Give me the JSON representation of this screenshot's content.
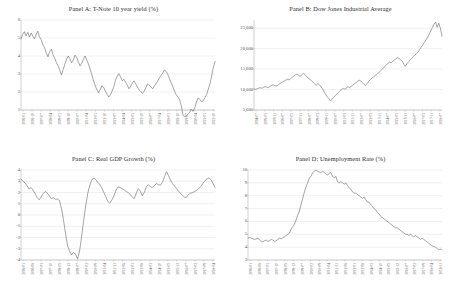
{
  "figure": {
    "background": "#ffffff",
    "line_color": "#5a5a5a",
    "grid_color": "#d9d9d9",
    "axis_color": "#9a9a9a",
    "panel_count": 4
  },
  "panels": [
    {
      "id": "panel-a",
      "title": "Panel A: T-Note 10 year yield (%)",
      "chart_data": {
        "type": "line",
        "title": "Panel A: T-Note 10 year yield (%)",
        "xlabel": "",
        "ylabel": "",
        "ylim": [
          1,
          6
        ],
        "yticks": [
          "6",
          "5",
          "4",
          "3",
          "2",
          "1"
        ],
        "grid": true,
        "legend": "none",
        "xtick_labels": [
          "2006-01",
          "2006-10",
          "2007-07",
          "2008-04",
          "2009-01",
          "2009-10",
          "2010-07",
          "2011-04",
          "2012-01",
          "2012-10",
          "2013-07",
          "2014-04",
          "2015-01",
          "2015-10",
          "2016-07",
          "2017-04",
          "2018-01",
          "2018-10",
          "2019-07",
          "2020-04",
          "2021-01",
          "2021-10"
        ],
        "series": [
          {
            "name": "T-Note 10 year yield",
            "values": [
              4.95,
              5.2,
              5.35,
              5.12,
              5.32,
              5.05,
              5.28,
              5.1,
              4.95,
              5.2,
              5.38,
              5.05,
              4.9,
              4.62,
              4.45,
              4.18,
              3.95,
              4.25,
              4.38,
              4.05,
              3.88,
              3.62,
              3.45,
              3.2,
              2.95,
              3.25,
              3.55,
              3.82,
              4.0,
              3.85,
              3.62,
              3.78,
              4.05,
              3.92,
              3.68,
              3.45,
              3.6,
              3.82,
              4.0,
              3.78,
              3.55,
              3.25,
              2.95,
              2.62,
              2.35,
              2.12,
              1.95,
              2.15,
              2.35,
              2.25,
              2.05,
              1.88,
              1.72,
              1.85,
              2.05,
              2.3,
              2.65,
              2.88,
              3.02,
              2.85,
              2.62,
              2.7,
              2.55,
              2.38,
              2.18,
              2.32,
              2.5,
              2.62,
              2.45,
              2.28,
              2.12,
              2.02,
              1.92,
              2.05,
              2.25,
              2.45,
              2.38,
              2.28,
              2.18,
              2.32,
              2.45,
              2.6,
              2.78,
              2.92,
              3.05,
              3.22,
              3.15,
              2.98,
              2.75,
              2.52,
              2.28,
              2.05,
              1.85,
              1.72,
              1.58,
              1.25,
              0.72,
              0.62,
              0.68,
              0.75,
              0.88,
              1.05,
              0.92,
              1.12,
              1.45,
              1.68,
              1.58,
              1.45,
              1.52,
              1.68,
              1.85,
              2.15,
              2.45,
              2.88,
              3.35,
              3.7
            ]
          }
        ]
      }
    },
    {
      "id": "panel-b",
      "title": "Panel B: Dow Jones Industrial Average",
      "chart_data": {
        "type": "line",
        "title": "Panel B: Dow Jones Industrial Average",
        "xlabel": "",
        "ylabel": "",
        "ylim": [
          5000,
          27000
        ],
        "yticks": [
          "25,000",
          "20,000",
          "15,000",
          "10,000",
          "5,000"
        ],
        "grid": true,
        "legend": "none",
        "xtick_labels": [
          "2004-07",
          "2005-03",
          "2005-11",
          "2006-07",
          "2007-03",
          "2007-11",
          "2008-07",
          "2009-03",
          "2009-11",
          "2010-07",
          "2011-03",
          "2011-11",
          "2012-07",
          "2013-03",
          "2013-11",
          "2014-07",
          "2015-03",
          "2015-11",
          "2016-07",
          "2017-03",
          "2017-11",
          "2018-07"
        ],
        "series": [
          {
            "name": "Dow Jones Industrial Average",
            "values": [
              10150,
              10050,
              10200,
              10350,
              10450,
              10300,
              10550,
              10700,
              10600,
              10450,
              10750,
              11000,
              11150,
              11000,
              10850,
              11100,
              11400,
              11600,
              11900,
              12100,
              12300,
              12500,
              12350,
              12700,
              13000,
              13300,
              13600,
              13800,
              13500,
              13200,
              13650,
              13950,
              13700,
              13200,
              12800,
              12500,
              12200,
              11800,
              11400,
              11000,
              11500,
              11200,
              10700,
              10200,
              9500,
              8800,
              8200,
              7800,
              7200,
              7600,
              8100,
              8500,
              8900,
              9300,
              9700,
              10000,
              10300,
              10100,
              10400,
              10700,
              10500,
              10800,
              11100,
              11400,
              11700,
              12000,
              12300,
              12100,
              11700,
              11300,
              11000,
              11500,
              12000,
              12400,
              12800,
              13100,
              13400,
              13700,
              14000,
              14400,
              14800,
              15200,
              15600,
              16000,
              16400,
              16700,
              16500,
              16900,
              17200,
              17500,
              17800,
              17600,
              17300,
              17000,
              16200,
              15700,
              16300,
              16800,
              17200,
              17600,
              18000,
              18400,
              18800,
              19200,
              19800,
              20400,
              21000,
              21600,
              22200,
              22800,
              23600,
              24400,
              25200,
              26000,
              26500,
              25200,
              26200,
              25000,
              23000
            ]
          }
        ]
      }
    },
    {
      "id": "panel-c",
      "title": "Panel C: Real GDP Growth (%)",
      "chart_data": {
        "type": "line",
        "title": "Panel C: Real GDP Growth (%)",
        "xlabel": "",
        "ylabel": "",
        "ylim": [
          -4,
          4
        ],
        "yticks": [
          "4",
          "3",
          "2",
          "1",
          "0",
          "-1",
          "-2",
          "-3",
          "-4"
        ],
        "grid": true,
        "legend": "none",
        "xtick_labels": [
          "2006-01",
          "2006-08",
          "2007-03",
          "2007-10",
          "2008-05",
          "2008-12",
          "2009-07",
          "2010-02",
          "2010-09",
          "2011-04",
          "2011-11",
          "2012-06",
          "2013-01",
          "2013-08",
          "2014-03",
          "2014-10",
          "2015-05",
          "2015-12",
          "2016-07",
          "2017-02",
          "2017-09",
          "2018-04"
        ],
        "series": [
          {
            "name": "Real GDP Growth",
            "values": [
              3.2,
              3.0,
              2.85,
              2.6,
              2.3,
              2.45,
              2.2,
              1.9,
              1.55,
              1.35,
              1.6,
              1.9,
              2.1,
              1.95,
              1.7,
              1.45,
              1.55,
              1.4,
              1.42,
              1.3,
              0.6,
              -0.4,
              -1.6,
              -2.7,
              -3.2,
              -3.55,
              -3.3,
              -3.5,
              -3.9,
              -3.2,
              -1.9,
              -0.5,
              0.8,
              1.9,
              2.6,
              3.1,
              3.3,
              3.15,
              2.9,
              2.7,
              2.4,
              2.0,
              1.6,
              1.2,
              1.05,
              1.35,
              1.7,
              2.2,
              2.5,
              2.45,
              2.35,
              2.25,
              2.1,
              2.0,
              1.85,
              1.6,
              1.45,
              1.9,
              2.35,
              2.15,
              1.7,
              2.0,
              2.5,
              2.7,
              2.5,
              2.45,
              2.6,
              2.8,
              2.7,
              2.65,
              2.9,
              3.4,
              3.85,
              3.5,
              3.1,
              2.8,
              2.55,
              2.35,
              2.1,
              1.9,
              1.75,
              1.55,
              1.6,
              1.85,
              1.95,
              2.0,
              2.1,
              2.2,
              2.35,
              2.55,
              2.8,
              3.05,
              3.2,
              3.3,
              3.15,
              2.8,
              2.45
            ]
          }
        ]
      }
    },
    {
      "id": "panel-d",
      "title": "Panel D: Unemployment Rate (%)",
      "chart_data": {
        "type": "line",
        "title": "Panel D: Unemployment Rate (%)",
        "xlabel": "",
        "ylabel": "",
        "ylim": [
          3,
          10
        ],
        "yticks": [
          "10",
          "9",
          "8",
          "7",
          "6",
          "5",
          "4",
          "3"
        ],
        "grid": true,
        "legend": "none",
        "xtick_labels": [
          "2006-01",
          "2006-08",
          "2007-03",
          "2007-10",
          "2008-05",
          "2008-12",
          "2009-07",
          "2010-02",
          "2010-09",
          "2011-04",
          "2011-11",
          "2012-06",
          "2013-01",
          "2013-08",
          "2014-03",
          "2014-10",
          "2015-05",
          "2015-12",
          "2016-07",
          "2017-02",
          "2017-09",
          "2018-04",
          "2018-11"
        ],
        "series": [
          {
            "name": "Unemployment Rate",
            "values": [
              4.7,
              4.75,
              4.7,
              4.65,
              4.6,
              4.65,
              4.7,
              4.55,
              4.45,
              4.4,
              4.5,
              4.55,
              4.45,
              4.5,
              4.6,
              4.55,
              4.45,
              4.5,
              4.6,
              4.7,
              4.65,
              4.75,
              4.8,
              4.9,
              5.0,
              5.1,
              5.4,
              5.6,
              5.8,
              6.1,
              6.5,
              6.8,
              7.3,
              7.8,
              8.3,
              8.7,
              9.0,
              9.4,
              9.5,
              9.8,
              9.9,
              10.0,
              9.9,
              9.85,
              9.8,
              9.9,
              9.8,
              9.7,
              9.6,
              9.75,
              9.8,
              9.5,
              9.4,
              9.5,
              9.1,
              9.0,
              9.1,
              9.0,
              8.9,
              9.0,
              8.8,
              8.6,
              8.5,
              8.3,
              8.2,
              8.2,
              8.1,
              8.0,
              7.9,
              7.8,
              7.9,
              7.7,
              7.5,
              7.5,
              7.3,
              7.2,
              7.0,
              6.9,
              6.7,
              6.6,
              6.4,
              6.3,
              6.2,
              6.1,
              6.0,
              5.9,
              5.8,
              5.7,
              5.6,
              5.5,
              5.5,
              5.4,
              5.3,
              5.2,
              5.1,
              5.0,
              5.0,
              4.9,
              5.0,
              4.9,
              4.8,
              4.9,
              4.8,
              4.7,
              4.6,
              4.7,
              4.6,
              4.5,
              4.4,
              4.3,
              4.2,
              4.1,
              4.05,
              4.0,
              3.9,
              3.8,
              3.85,
              3.8
            ]
          }
        ]
      }
    }
  ]
}
